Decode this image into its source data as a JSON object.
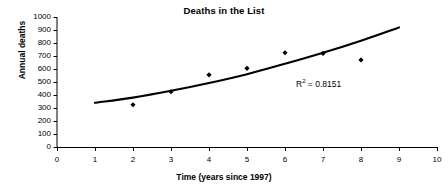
{
  "chart_data": {
    "type": "scatter",
    "title": "Deaths in the List",
    "xlabel": "Time (years since 1997)",
    "ylabel": "Annual deaths",
    "xlim": [
      0,
      10
    ],
    "ylim": [
      0,
      1000
    ],
    "xticks": [
      0,
      1,
      2,
      3,
      4,
      5,
      6,
      7,
      8,
      9,
      10
    ],
    "yticks": [
      0,
      100,
      200,
      300,
      400,
      500,
      600,
      700,
      800,
      900,
      1000
    ],
    "grid": false,
    "legend": null,
    "marker_color": "#000000",
    "trendline_color": "#000000",
    "series": [
      {
        "name": "Annual deaths",
        "x": [
          2,
          3,
          4,
          5,
          6,
          7,
          8
        ],
        "values": [
          325,
          425,
          555,
          605,
          725,
          720,
          670
        ]
      }
    ],
    "trendline": {
      "type": "exponential",
      "x_start": 1,
      "x_end": 9,
      "y_start": 340,
      "y_end": 920,
      "points": [
        [
          1,
          340
        ],
        [
          2,
          380
        ],
        [
          3,
          432
        ],
        [
          4,
          492
        ],
        [
          5,
          560
        ],
        [
          6,
          640
        ],
        [
          7,
          725
        ],
        [
          8,
          818
        ],
        [
          9,
          920
        ]
      ]
    },
    "annotations": [
      {
        "name": "r-squared",
        "prefix": "R",
        "superscript": "2",
        "suffix": " = 0.8151",
        "text": "R2 = 0.8151"
      }
    ]
  },
  "axis": {
    "y_tick_labels": [
      "1000",
      "900",
      "800",
      "700",
      "600",
      "500",
      "400",
      "300",
      "200",
      "100",
      "0"
    ],
    "x_tick_labels": [
      "0",
      "1",
      "2",
      "3",
      "4",
      "5",
      "6",
      "7",
      "8",
      "9",
      "10"
    ]
  }
}
